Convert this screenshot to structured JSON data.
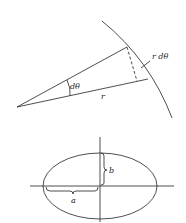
{
  "figures": [
    {
      "id": "arc-length",
      "description": "Sector of a circle showing arc length element r dθ",
      "labels": {
        "angle": "dθ",
        "radius": "r",
        "arc_element": "r dθ"
      }
    },
    {
      "id": "ellipse",
      "description": "Ellipse with semi-axes a and b on coordinate axes",
      "labels": {
        "semi_major": "a",
        "semi_minor": "b"
      }
    }
  ],
  "colors": {
    "stroke": "#222222",
    "background": "#ffffff"
  }
}
